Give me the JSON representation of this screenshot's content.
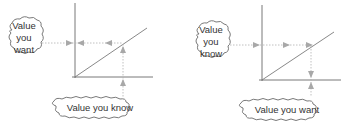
{
  "diagrams": [
    {
      "id": "left",
      "side_cloud": {
        "lines": [
          "Value",
          "you",
          "want"
        ]
      },
      "bottom_cloud": {
        "text": "Value you know"
      },
      "description": "Read upward from known x-value to line, then left to wanted y-value"
    },
    {
      "id": "right",
      "side_cloud": {
        "lines": [
          "Value",
          "you",
          "know"
        ]
      },
      "bottom_cloud": {
        "text": "Value you want"
      },
      "description": "Read rightward from known y-value to line, then down to wanted x-value"
    }
  ],
  "colors": {
    "axis": "#6a6a6a",
    "line": "#7a7a7a",
    "dotted": "#b0b0b0",
    "arrow": "#a8a8a8",
    "cloud": "#6a6a6a",
    "text": "#333333"
  }
}
